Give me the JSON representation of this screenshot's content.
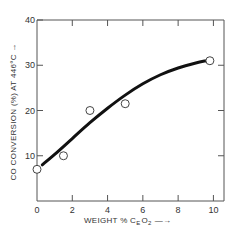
{
  "chart_data": {
    "type": "scatter",
    "title": "",
    "xlabel": "WEIGHT % CeO2 →",
    "xlabel_parts": {
      "main": "WEIGHT % C",
      "sub_e": "E",
      "o": "O",
      "sub_2": "2",
      "arrow": "—→"
    },
    "ylabel": "CO CONVERSION (%) AT 446°C →",
    "xlim": [
      0,
      10.6
    ],
    "ylim": [
      0,
      40
    ],
    "xticks": [
      0,
      2,
      4,
      6,
      8,
      10
    ],
    "xtick_labels": [
      "0",
      "2",
      "4",
      "6",
      "8",
      "10"
    ],
    "yticks": [
      10,
      20,
      30,
      40
    ],
    "ytick_labels": [
      "10",
      "20",
      "30",
      "40"
    ],
    "grid": false,
    "series": [
      {
        "name": "measured",
        "marker": "open-circle",
        "x": [
          0,
          1.5,
          3,
          5,
          9.8
        ],
        "y": [
          7,
          10,
          20,
          21.5,
          31
        ]
      },
      {
        "name": "fitted-curve",
        "marker": "line",
        "x": [
          0.3,
          1,
          2,
          3,
          4,
          5,
          6,
          7,
          8,
          9,
          9.6
        ],
        "y": [
          8,
          10.3,
          13.8,
          17.3,
          20.5,
          23.4,
          25.9,
          27.9,
          29.4,
          30.5,
          31
        ]
      }
    ],
    "colors": {
      "ink": "#111111",
      "axis": "#555555"
    }
  }
}
